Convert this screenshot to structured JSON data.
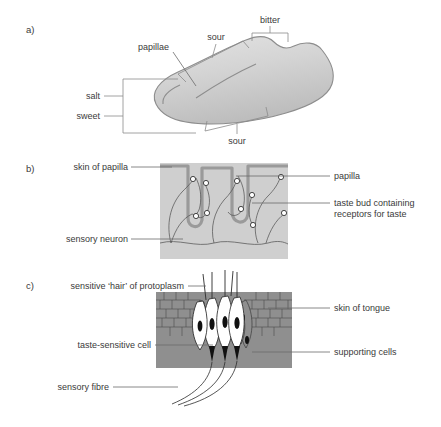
{
  "figure": {
    "background_color": "#ffffff",
    "text_color": "#3a3a3a"
  },
  "panels": [
    {
      "id": "a",
      "label": "a)",
      "caption": "Tongue taste map",
      "fill_color": "#d2d2d2",
      "labels": [
        {
          "name": "bitter",
          "text": "bitter"
        },
        {
          "name": "sour-upper",
          "text": "sour"
        },
        {
          "name": "sour-lower",
          "text": "sour"
        },
        {
          "name": "papillae",
          "text": "papillae"
        },
        {
          "name": "salt",
          "text": "salt"
        },
        {
          "name": "sweet",
          "text": "sweet"
        }
      ]
    },
    {
      "id": "b",
      "label": "b)",
      "caption": "Section through papillae",
      "fill_color": "#cfcfcf",
      "labels": [
        {
          "name": "skin-of-papilla",
          "text": "skin of papilla"
        },
        {
          "name": "sensory-neuron",
          "text": "sensory neuron"
        },
        {
          "name": "papilla",
          "text": "papilla"
        },
        {
          "name": "taste-bud-line1",
          "text": "taste bud containing"
        },
        {
          "name": "taste-bud-line2",
          "text": "receptors for taste"
        }
      ]
    },
    {
      "id": "c",
      "label": "c)",
      "caption": "Taste bud cellular detail",
      "fill_color": "#8f8f8f",
      "labels": [
        {
          "name": "sensitive-hair",
          "text": "sensitive ‘hair’ of protoplasm"
        },
        {
          "name": "taste-sensitive-cell",
          "text": "taste-sensitive cell"
        },
        {
          "name": "sensory-fibre",
          "text": "sensory fibre"
        },
        {
          "name": "skin-of-tongue",
          "text": "skin of tongue"
        },
        {
          "name": "supporting-cells",
          "text": "supporting cells"
        }
      ]
    }
  ]
}
